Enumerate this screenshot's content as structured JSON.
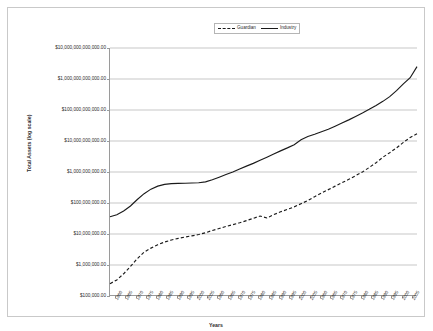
{
  "chart_data": {
    "type": "line",
    "title": "",
    "xlabel": "Years",
    "ylabel": "Total Assets (log scale)",
    "yscale": "log",
    "ylim": [
      100000,
      10000000000000
    ],
    "xlim": [
      1960,
      2005
    ],
    "grid": true,
    "legend_position": "top-center",
    "ytick_labels": [
      "$10,000,000,000,000.00",
      "$1,000,000,000,000.00",
      "$100,000,000,000.00",
      "$10,000,000,000.00",
      "$1,000,000,000.00",
      "$100,000,000.00",
      "$10,000,000.00",
      "$1,000,000.00",
      "$100,000.00"
    ],
    "ytick_values": [
      10000000000000,
      1000000000000,
      100000000000,
      10000000000,
      1000000000,
      100000000,
      10000000,
      1000000,
      100000
    ],
    "xtick_labels": [
      "1960",
      "1965",
      "1970",
      "1975",
      "1980",
      "1985",
      "1990",
      "1995",
      "2000",
      "2005",
      "1960",
      "1965",
      "1970",
      "1975",
      "1980",
      "1985",
      "1990",
      "1995",
      "2000",
      "2005",
      "1960",
      "1965",
      "1970",
      "1975",
      "1980",
      "1985",
      "1990",
      "1995",
      "2000",
      "2005"
    ],
    "x": [
      1960,
      1961,
      1962,
      1963,
      1964,
      1965,
      1966,
      1967,
      1968,
      1969,
      1970,
      1971,
      1972,
      1973,
      1974,
      1975,
      1976,
      1977,
      1978,
      1979,
      1980,
      1981,
      1982,
      1983,
      1984,
      1985,
      1986,
      1987,
      1988,
      1989,
      1990,
      1991,
      1992,
      1993,
      1994,
      1995,
      1996,
      1997,
      1998,
      1999,
      2000,
      2001,
      2002,
      2003,
      2004,
      2005
    ],
    "series": [
      {
        "name": "Guardian",
        "style": "dashed",
        "values": [
          250000,
          330000,
          520000,
          900000,
          1600000,
          2600000,
          3500000,
          4500000,
          5500000,
          6400000,
          7200000,
          8000000,
          8700000,
          9600000,
          11000000,
          13000000,
          15000000,
          17500000,
          20000000,
          23000000,
          27000000,
          32000000,
          38000000,
          33000000,
          42000000,
          52000000,
          62000000,
          75000000,
          95000000,
          120000000,
          160000000,
          210000000,
          270000000,
          350000000,
          450000000,
          580000000,
          760000000,
          1000000000,
          1400000000,
          2000000000,
          3000000000,
          4200000000,
          6000000000,
          9000000000,
          13000000000,
          17000000000
        ]
      },
      {
        "name": "Industry",
        "style": "solid",
        "values": [
          36000000,
          42000000,
          55000000,
          80000000,
          130000000,
          200000000,
          280000000,
          350000000,
          400000000,
          420000000,
          430000000,
          435000000,
          440000000,
          450000000,
          480000000,
          560000000,
          680000000,
          830000000,
          1000000000,
          1250000000,
          1550000000,
          1900000000,
          2400000000,
          3000000000,
          3800000000,
          4800000000,
          6000000000,
          7600000000,
          11000000000,
          14000000000,
          16500000000,
          20000000000,
          24000000000,
          30000000000,
          38000000000,
          48000000000,
          62000000000,
          80000000000,
          105000000000,
          140000000000,
          190000000000,
          270000000000,
          420000000000,
          700000000000,
          1100000000000,
          2500000000000
        ]
      }
    ]
  },
  "legend": {
    "entries": [
      {
        "label": "Guardian"
      },
      {
        "label": "Industry"
      }
    ]
  }
}
